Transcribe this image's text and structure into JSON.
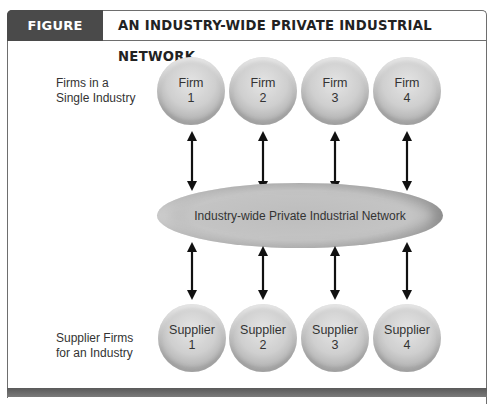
{
  "figure": {
    "number_label": "FIGURE 12.17",
    "title": "AN INDUSTRY-WIDE PRIVATE INDUSTRIAL NETWORK"
  },
  "rows": {
    "firms_label_line1": "Firms in a",
    "firms_label_line2": "Single Industry",
    "suppliers_label_line1": "Supplier Firms",
    "suppliers_label_line2": "for an Industry"
  },
  "firms": [
    {
      "name": "Firm",
      "number": "1"
    },
    {
      "name": "Firm",
      "number": "2"
    },
    {
      "name": "Firm",
      "number": "3"
    },
    {
      "name": "Firm",
      "number": "4"
    }
  ],
  "suppliers": [
    {
      "name": "Supplier",
      "number": "1"
    },
    {
      "name": "Supplier",
      "number": "2"
    },
    {
      "name": "Supplier",
      "number": "3"
    },
    {
      "name": "Supplier",
      "number": "4"
    }
  ],
  "network": {
    "label": "Industry-wide Private Industrial Network"
  },
  "connections": [
    {
      "from": "Firm 1",
      "to": "Industry-wide Private Industrial Network",
      "type": "bidirectional"
    },
    {
      "from": "Firm 2",
      "to": "Industry-wide Private Industrial Network",
      "type": "bidirectional"
    },
    {
      "from": "Firm 3",
      "to": "Industry-wide Private Industrial Network",
      "type": "bidirectional"
    },
    {
      "from": "Firm 4",
      "to": "Industry-wide Private Industrial Network",
      "type": "bidirectional"
    },
    {
      "from": "Industry-wide Private Industrial Network",
      "to": "Supplier 1",
      "type": "bidirectional"
    },
    {
      "from": "Industry-wide Private Industrial Network",
      "to": "Supplier 2",
      "type": "bidirectional"
    },
    {
      "from": "Industry-wide Private Industrial Network",
      "to": "Supplier 3",
      "type": "bidirectional"
    },
    {
      "from": "Industry-wide Private Industrial Network",
      "to": "Supplier 4",
      "type": "bidirectional"
    }
  ],
  "colors": {
    "header_tag_bg": "#4a4a4a",
    "frame": "#6e6e6e",
    "arrow": "#111111"
  }
}
